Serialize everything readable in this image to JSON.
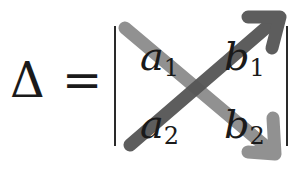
{
  "formula": {
    "lhs": "Δ",
    "equals": "=",
    "matrix": [
      [
        {
          "var": "a",
          "sub": "1"
        },
        {
          "var": "b",
          "sub": "1"
        }
      ],
      [
        {
          "var": "a",
          "sub": "2"
        },
        {
          "var": "b",
          "sub": "2"
        }
      ]
    ]
  },
  "arrows": [
    {
      "name": "diagonal-main",
      "from": "a1",
      "to": "b2",
      "color": "#8a8a8a"
    },
    {
      "name": "diagonal-anti",
      "from": "a2",
      "to": "b1",
      "color": "#555555"
    }
  ]
}
